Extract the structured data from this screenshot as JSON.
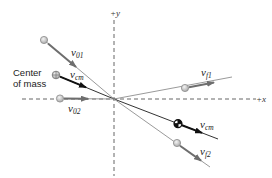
{
  "diagram": {
    "axes": {
      "x_label": "+x",
      "y_label": "+y"
    },
    "center_of_mass_label": {
      "line1": "Center",
      "line2": "of mass"
    },
    "vectors": {
      "v01": {
        "symbol": "v",
        "subscript": "01"
      },
      "v02": {
        "symbol": "v",
        "subscript": "02"
      },
      "vcm_initial": {
        "symbol": "v",
        "subscript": "cm"
      },
      "vf1": {
        "symbol": "v",
        "subscript": "f1"
      },
      "vf2": {
        "symbol": "v",
        "subscript": "f2"
      },
      "vcm_final": {
        "symbol": "v",
        "subscript": "cm"
      }
    },
    "colors": {
      "axis": "#555555",
      "path_light": "#9a9a9a",
      "path_cm": "#333333",
      "arrow_gray": "#707070",
      "arrow_black": "#111111",
      "ball_fill": "#c8c8c8",
      "ball_stroke": "#8a8a8a"
    }
  }
}
